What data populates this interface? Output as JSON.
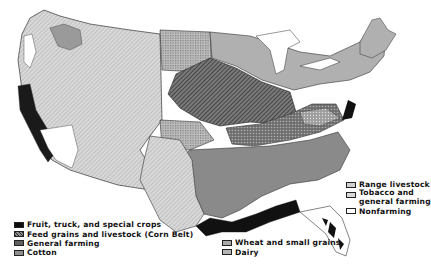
{
  "map": {
    "title": "Type-of-farming regions of the United States",
    "subject": "Agricultural regions, conterminous United States"
  },
  "legend": {
    "left": [
      {
        "key": "fruit",
        "label": "Fruit, truck, and special crops",
        "color": "#0d0d0d",
        "pattern": "solid-black"
      },
      {
        "key": "cornbelt",
        "label": "Feed grains and livestock (Corn Belt)",
        "color": "#5a5a5a",
        "pattern": "diagonal-hatch"
      },
      {
        "key": "general",
        "label": "General farming",
        "color": "#6b6b6b",
        "pattern": "crosshatch-dots"
      },
      {
        "key": "cotton",
        "label": "Cotton",
        "color": "#8c8c8c",
        "pattern": "medium-gray"
      }
    ],
    "middle": [
      {
        "key": "wheat",
        "label": "Wheat and small grains",
        "color": "#a8a8a8",
        "pattern": "fine-grid"
      },
      {
        "key": "dairy",
        "label": "Dairy",
        "color": "#b4b4b4",
        "pattern": "light-gray"
      }
    ],
    "right": [
      {
        "key": "range",
        "label": "Range livestock",
        "color": "#cfcfcf",
        "pattern": "fine-diagonal-light"
      },
      {
        "key": "tobacco",
        "label_line1": "Tobacco and",
        "label_line2": "general farming",
        "color": "#d8d8d8",
        "pattern": "light-dots"
      },
      {
        "key": "nonfarming",
        "label": "Nonfarming",
        "color": "#ffffff",
        "pattern": "white"
      }
    ]
  }
}
